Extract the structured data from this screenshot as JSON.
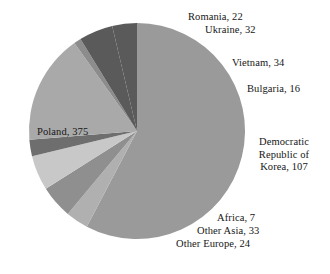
{
  "chart_data": {
    "type": "pie",
    "title": "",
    "total": 650,
    "center": {
      "x": 137,
      "y": 131
    },
    "radius": 108,
    "start_angle_deg": -90,
    "direction": "clockwise",
    "legend": "none",
    "labels_position": "outside-callout",
    "categories": [
      "Poland",
      "Romania",
      "Ukraine",
      "Vietnam",
      "Bulgaria",
      "Democratic Republic of Korea",
      "Africa",
      "Other Asia",
      "Other Europe"
    ],
    "values": [
      375,
      22,
      32,
      34,
      16,
      107,
      7,
      33,
      24
    ],
    "colors": [
      "#9a9a9a",
      "#b0b0b0",
      "#8f8f8f",
      "#c8c8c8",
      "#6e6e6e",
      "#a9a9a9",
      "#8c8c8c",
      "#5a5a5a",
      "#5a5a5a"
    ],
    "slices": [
      {
        "name": "Poland",
        "value": 375,
        "label": "Poland, 375",
        "color": "#9a9a9a"
      },
      {
        "name": "Romania",
        "value": 22,
        "label": "Romania, 22",
        "color": "#b0b0b0"
      },
      {
        "name": "Ukraine",
        "value": 32,
        "label": "Ukraine, 32",
        "color": "#8f8f8f"
      },
      {
        "name": "Vietnam",
        "value": 34,
        "label": "Vietnam, 34",
        "color": "#c8c8c8"
      },
      {
        "name": "Bulgaria",
        "value": 16,
        "label": "Bulgaria, 16",
        "color": "#6e6e6e"
      },
      {
        "name": "Democratic Republic of Korea",
        "value": 107,
        "label": "Democratic Republic of Korea, 107",
        "color": "#a9a9a9"
      },
      {
        "name": "Africa",
        "value": 7,
        "label": "Africa, 7",
        "color": "#8c8c8c"
      },
      {
        "name": "Other Asia",
        "value": 33,
        "label": "Other Asia, 33",
        "color": "#5a5a5a"
      },
      {
        "name": "Other Europe",
        "value": 24,
        "label": "Other Europe, 24",
        "color": "#5a5a5a"
      }
    ]
  },
  "labels": {
    "romania": "Romania, 22",
    "ukraine": "Ukraine, 32",
    "vietnam": "Vietnam, 34",
    "bulgaria": "Bulgaria, 16",
    "dprk_line1": "Democratic",
    "dprk_line2": "Republic of",
    "dprk_line3": "Korea, 107",
    "poland": "Poland, 375",
    "africa": "Africa, 7",
    "other_asia": "Other Asia, 33",
    "other_europe": "Other Europe, 24"
  }
}
